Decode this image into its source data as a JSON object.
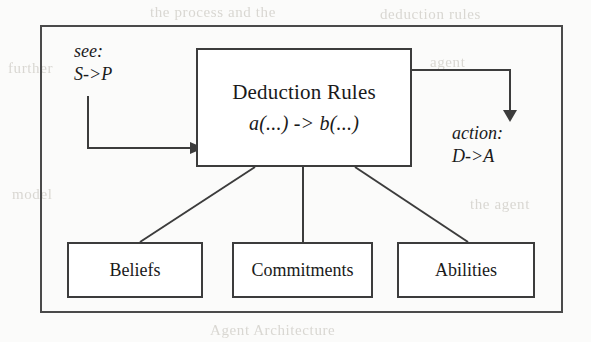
{
  "figure": {
    "kind": "block-diagram",
    "background_color": "#fbfbfa",
    "line_color": "#3c3c3c",
    "text_color": "#1a1a1a"
  },
  "labels": {
    "see": {
      "name": "see:",
      "mapping": "S->P"
    },
    "action": {
      "name": "action:",
      "mapping": "D->A"
    }
  },
  "main_node": {
    "title": "Deduction Rules",
    "formula": "a(...) -> b(...)"
  },
  "leaf_nodes": [
    {
      "label": "Beliefs"
    },
    {
      "label": "Commitments"
    },
    {
      "label": "Abilities"
    }
  ],
  "ghost_text": {
    "line1": "the process and the",
    "line2": "deduction rules",
    "line3": "further",
    "line4": "agent",
    "line5": "model",
    "line6": "the agent",
    "line7": "Agent Architecture"
  }
}
